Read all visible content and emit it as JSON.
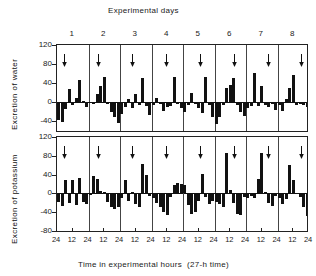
{
  "figure": {
    "top_title": "Experimental days",
    "xlabel": "Time in experimental hours  (27-h time)",
    "day_labels": [
      "1",
      "2",
      "3",
      "4",
      "5",
      "6",
      "7",
      "8"
    ],
    "xtick_labels": [
      "24",
      "12",
      "24",
      "12",
      "24",
      "12",
      "24",
      "12",
      "24",
      "12",
      "24",
      "12",
      "24",
      "12",
      "24",
      "12",
      "24"
    ],
    "arrow_marker": "down-arrow"
  },
  "chart_data": [
    {
      "type": "bar",
      "title": "Experimental days",
      "ylabel": "Excretion of water",
      "xlabel": "",
      "ylim": [
        -60,
        120
      ],
      "yticks": [
        120,
        80,
        40,
        0,
        -40
      ],
      "ytick_labels": [
        "120",
        "80",
        "40",
        "0",
        "-40"
      ],
      "grid": false,
      "legend": "none",
      "categories": [
        "1",
        "2",
        "3",
        "4",
        "5",
        "6",
        "7",
        "8"
      ],
      "bars_per_day": 9,
      "values": [
        [
          -38,
          -42,
          -14,
          27,
          -5,
          10,
          46,
          3,
          -9
        ],
        [
          -2,
          -4,
          18,
          35,
          53,
          -4,
          -20,
          -30,
          -44
        ],
        [
          -24,
          -10,
          7,
          -12,
          18,
          -6,
          51,
          -8,
          -27
        ],
        [
          -5,
          10,
          -4,
          -18,
          -10,
          -8,
          53,
          -4,
          -12
        ],
        [
          -20,
          -6,
          20,
          -4,
          -12,
          -22,
          52,
          -6,
          -30
        ],
        [
          -46,
          -30,
          -6,
          30,
          37,
          51,
          -6,
          -20,
          -28
        ],
        [
          -12,
          -8,
          62,
          -8,
          35,
          -6,
          -10,
          -4,
          -16
        ],
        [
          -6,
          -18,
          6,
          30,
          57,
          -6,
          -3,
          -5,
          -10
        ]
      ],
      "annotations": [
        {
          "type": "arrow",
          "day": 1,
          "direction": "down"
        },
        {
          "type": "arrow",
          "day": 2,
          "direction": "down"
        },
        {
          "type": "arrow",
          "day": 3,
          "direction": "down"
        },
        {
          "type": "arrow",
          "day": 4,
          "direction": "down"
        },
        {
          "type": "arrow",
          "day": 5,
          "direction": "down"
        },
        {
          "type": "arrow",
          "day": 6,
          "direction": "down"
        },
        {
          "type": "arrow",
          "day": 7,
          "direction": "down"
        },
        {
          "type": "arrow",
          "day": 8,
          "direction": "down"
        }
      ]
    },
    {
      "type": "bar",
      "title": "",
      "ylabel": "Excretion of potassium",
      "xlabel": "Time in experimental hours  (27-h time)",
      "ylim": [
        -80,
        120
      ],
      "yticks": [
        120,
        80,
        40,
        0,
        -40,
        -80
      ],
      "ytick_labels": [
        "120",
        "80",
        "40",
        "0",
        "-40",
        "-80"
      ],
      "grid": false,
      "legend": "none",
      "categories": [
        "1",
        "2",
        "3",
        "4",
        "5",
        "6",
        "7",
        "8"
      ],
      "bars_per_day": 9,
      "values": [
        [
          -18,
          -26,
          28,
          -20,
          28,
          -24,
          32,
          -18,
          -22
        ],
        [
          -4,
          36,
          30,
          6,
          4,
          -18,
          -30,
          -34,
          -30
        ],
        [
          -10,
          28,
          -16,
          3,
          -22,
          -30,
          62,
          40,
          -6
        ],
        [
          -10,
          -20,
          -30,
          -40,
          -46,
          -8,
          18,
          23,
          20
        ],
        [
          18,
          -24,
          -44,
          -40,
          -16,
          42,
          -8,
          -22,
          -16
        ],
        [
          -18,
          -22,
          -30,
          85,
          7,
          -20,
          -44,
          -46,
          -8
        ],
        [
          -10,
          -6,
          -10,
          30,
          85,
          2,
          -20,
          -26,
          -6
        ],
        [
          -10,
          -22,
          -12,
          60,
          28,
          -2,
          -8,
          -30,
          -48
        ]
      ],
      "annotations": [
        {
          "type": "arrow",
          "day": 1,
          "direction": "down"
        },
        {
          "type": "arrow",
          "day": 2,
          "direction": "down"
        },
        {
          "type": "arrow",
          "day": 3,
          "direction": "down"
        },
        {
          "type": "arrow",
          "day": 4,
          "direction": "down"
        },
        {
          "type": "arrow",
          "day": 5,
          "direction": "down"
        },
        {
          "type": "arrow",
          "day": 6,
          "direction": "down"
        },
        {
          "type": "arrow",
          "day": 7,
          "direction": "down"
        },
        {
          "type": "arrow",
          "day": 8,
          "direction": "down"
        }
      ]
    }
  ]
}
